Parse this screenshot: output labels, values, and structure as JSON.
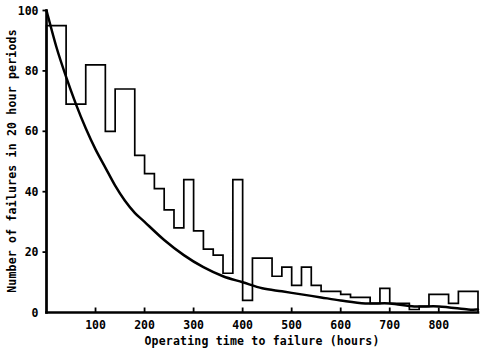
{
  "chart_data": {
    "type": "bar",
    "title": "",
    "subtitle": "",
    "xlabel": "Operating time to failure (hours)",
    "ylabel": "Number of failures in 20 hour periods",
    "xlim": [
      0,
      880
    ],
    "ylim": [
      0,
      100
    ],
    "grid": false,
    "legend": null,
    "bin_width": 20,
    "x_ticks": [
      100,
      200,
      300,
      400,
      500,
      600,
      700,
      800
    ],
    "x_tick_labels": [
      "100",
      "200",
      "300",
      "400",
      "500",
      "600",
      "700",
      "800"
    ],
    "y_ticks": [
      0,
      20,
      40,
      60,
      80,
      100
    ],
    "y_tick_labels": [
      "0",
      "20",
      "40",
      "60",
      "80",
      "100"
    ],
    "categories": [
      "0-20",
      "20-40",
      "40-60",
      "60-80",
      "80-100",
      "100-120",
      "120-140",
      "140-160",
      "160-180",
      "180-200",
      "200-220",
      "220-240",
      "240-260",
      "260-280",
      "280-300",
      "300-320",
      "320-340",
      "340-360",
      "360-380",
      "380-400",
      "400-420",
      "420-440",
      "440-460",
      "460-480",
      "480-500",
      "500-520",
      "520-540",
      "540-560",
      "560-580",
      "580-600",
      "600-620",
      "620-640",
      "640-660",
      "660-680",
      "680-700",
      "700-720",
      "720-740",
      "740-760",
      "760-780",
      "780-800",
      "800-820",
      "820-840",
      "840-860",
      "860-880"
    ],
    "values": [
      95,
      95,
      69,
      69,
      82,
      82,
      60,
      74,
      74,
      52,
      46,
      41,
      34,
      28,
      44,
      27,
      21,
      19,
      13,
      44,
      4,
      18,
      18,
      12,
      15,
      9,
      15,
      9,
      7,
      7,
      6,
      5,
      5,
      3,
      8,
      3,
      3,
      1,
      2,
      6,
      6,
      3,
      7,
      7
    ],
    "series": [
      {
        "name": "fitted exponential curve",
        "type": "line",
        "x": [
          0,
          20,
          40,
          60,
          80,
          100,
          120,
          140,
          160,
          180,
          200,
          240,
          280,
          320,
          360,
          400,
          440,
          480,
          520,
          560,
          600,
          650,
          700,
          750,
          800,
          860,
          880
        ],
        "y": [
          100,
          88,
          78,
          69,
          61,
          54,
          48,
          42,
          37,
          33,
          30,
          24,
          19,
          15,
          12,
          10,
          8,
          7,
          6,
          5,
          4,
          3,
          3,
          2,
          2,
          1,
          1
        ]
      }
    ]
  }
}
